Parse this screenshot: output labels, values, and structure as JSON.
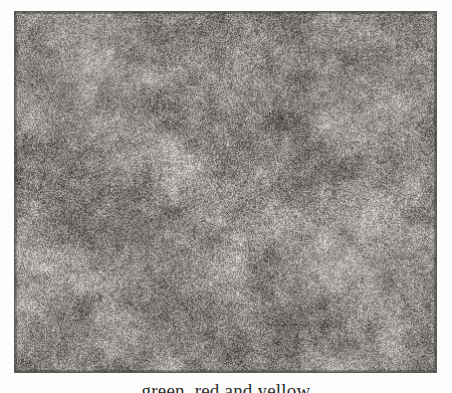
{
  "page": {
    "background_color": "#fdfdfc",
    "kind": "scanned-book-page"
  },
  "plate": {
    "name": "grayscale-photomicrograph-plate",
    "alt_text": "Dense mottled grey photomicrograph texture",
    "border_color": "#5a5a58",
    "base_tone": "#8d8d8b",
    "light_tone": "#c9c9c7",
    "dark_tone": "#474745",
    "x": 14,
    "y": 11,
    "width": 423,
    "height": 362
  },
  "caption": {
    "text": "green, red and yellow",
    "clipped": "bottom-cropped"
  }
}
